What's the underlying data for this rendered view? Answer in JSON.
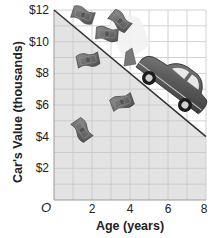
{
  "chart_data": {
    "type": "line",
    "title": "",
    "xlabel": "Age (years)",
    "ylabel": "Car's Value (thousands)",
    "xlim": [
      0,
      8
    ],
    "ylim": [
      0,
      12
    ],
    "x_ticks": [
      2,
      4,
      6,
      8
    ],
    "x_tick_labels": [
      "2",
      "4",
      "6",
      "8"
    ],
    "y_ticks": [
      2,
      4,
      6,
      8,
      10,
      12
    ],
    "y_tick_labels": [
      "$2",
      "$4",
      "$6",
      "$8",
      "$10",
      "$12"
    ],
    "origin_label": "O",
    "grid": true,
    "grid_x_step": 1,
    "grid_y_step": 1,
    "series": [
      {
        "name": "Car's Value",
        "x": [
          0,
          8
        ],
        "y": [
          12,
          4
        ],
        "color": "#333333"
      }
    ],
    "shaded_region": "below line",
    "illustration": "car sliding down the line with dollar bills flying off",
    "colors": {
      "shade": "#e3e3e3",
      "grid": "#c4c4c4",
      "line": "#333333",
      "car": "#6a6a6a",
      "money": "#6e6e6e"
    }
  }
}
